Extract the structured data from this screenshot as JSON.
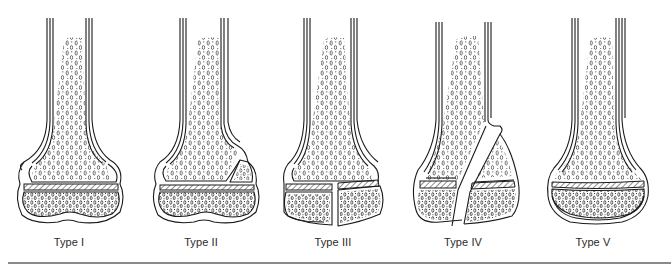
{
  "figure": {
    "colors": {
      "line": "#1a1a1a",
      "hatch": "#333333",
      "background": "#ffffff",
      "rule": "#8a8a8a"
    },
    "panels": [
      {
        "id": "type-1",
        "label": "Type I"
      },
      {
        "id": "type-2",
        "label": "Type II"
      },
      {
        "id": "type-3",
        "label": "Type III"
      },
      {
        "id": "type-4",
        "label": "Type IV"
      },
      {
        "id": "type-5",
        "label": "Type V"
      }
    ]
  }
}
